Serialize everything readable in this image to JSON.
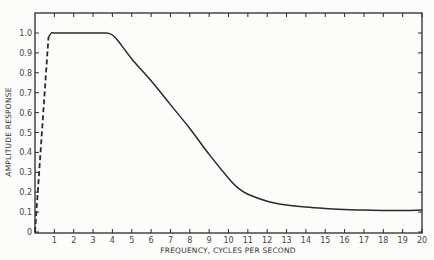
{
  "chart_data": {
    "type": "line",
    "title": "",
    "xlabel": "FREQUENCY, CYCLES PER SECOND",
    "ylabel": "AMPLITUDE RESPONSE",
    "xlim": [
      0,
      20
    ],
    "ylim": [
      0,
      1.1
    ],
    "grid": false,
    "legend": null,
    "x_ticks": [
      "1",
      "2",
      "3",
      "4",
      "5",
      "6",
      "7",
      "8",
      "9",
      "10",
      "11",
      "12",
      "13",
      "14",
      "15",
      "16",
      "17",
      "18",
      "19",
      "20"
    ],
    "y_ticks": [
      "0",
      "0.1",
      "0.2",
      "0.3",
      "0.4",
      "0.5",
      "0.6",
      "0.7",
      "0.8",
      "0.9",
      "1.0"
    ],
    "series": [
      {
        "name": "low-frequency rise (dashed)",
        "style": "dashed",
        "x": [
          0,
          0.7
        ],
        "y": [
          0,
          0.98
        ]
      },
      {
        "name": "amplitude response",
        "style": "solid",
        "x": [
          0.7,
          0.85,
          1,
          2,
          3,
          3.7,
          4.0,
          4.3,
          5,
          6,
          7,
          8,
          9,
          10,
          10.5,
          11,
          12,
          13,
          14,
          15,
          16,
          17,
          18,
          19,
          20
        ],
        "y": [
          0.98,
          1.0,
          1.0,
          1.0,
          1.0,
          1.0,
          0.99,
          0.96,
          0.87,
          0.76,
          0.64,
          0.52,
          0.39,
          0.27,
          0.22,
          0.19,
          0.155,
          0.135,
          0.125,
          0.118,
          0.113,
          0.11,
          0.108,
          0.108,
          0.11
        ]
      }
    ]
  }
}
